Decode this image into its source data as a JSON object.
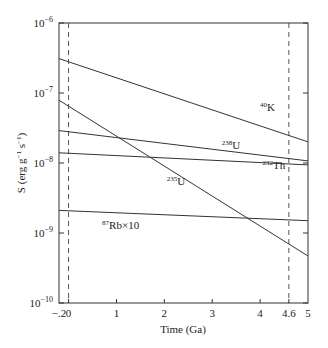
{
  "chart_data": {
    "type": "line",
    "title": "",
    "xlabel": "Time (Ga)",
    "ylabel": "S (erg g⁻¹ s⁻¹)",
    "xlim": [
      -0.2,
      5
    ],
    "ylim": [
      1e-10,
      1e-06
    ],
    "yscale": "log",
    "grid": false,
    "legend": "inline labels",
    "x_ticks": [
      {
        "value": -0.2,
        "label": "−2"
      },
      {
        "value": 0,
        "label": "0"
      },
      {
        "value": 1,
        "label": "1"
      },
      {
        "value": 2,
        "label": "2"
      },
      {
        "value": 3,
        "label": "3"
      },
      {
        "value": 4,
        "label": "4"
      },
      {
        "value": 4.6,
        "label": "4.6"
      },
      {
        "value": 5,
        "label": "5"
      }
    ],
    "y_ticks": [
      {
        "exp": -6,
        "base": "10",
        "sup": "−6"
      },
      {
        "exp": -7,
        "base": "10",
        "sup": "−7"
      },
      {
        "exp": -8,
        "base": "10",
        "sup": "−8"
      },
      {
        "exp": -9,
        "base": "10",
        "sup": "−9"
      },
      {
        "exp": -10,
        "base": "10",
        "sup": "−10"
      }
    ],
    "reference_lines": [
      {
        "x": 0,
        "style": "dashed"
      },
      {
        "x": 4.6,
        "style": "dashed"
      }
    ],
    "series": [
      {
        "name": "40K",
        "sup": "40",
        "base": "K",
        "x": [
          -0.2,
          5
        ],
        "values": [
          3.1e-07,
          2e-08
        ],
        "label_at": [
          4.0,
          5.6e-08
        ]
      },
      {
        "name": "238U",
        "sup": "238",
        "base": "U",
        "x": [
          -0.2,
          5
        ],
        "values": [
          2.9e-08,
          1.07e-08
        ],
        "label_at": [
          3.2,
          1.6e-08
        ]
      },
      {
        "name": "232Th",
        "sup": "232",
        "base": "Th",
        "x": [
          -0.2,
          5
        ],
        "values": [
          1.4e-08,
          9.4e-09
        ],
        "label_at": [
          4.05,
          8.2e-09
        ]
      },
      {
        "name": "235U",
        "sup": "235",
        "base": "U",
        "x": [
          -0.2,
          5
        ],
        "values": [
          7.9e-08,
          4.7e-10
        ],
        "label_at": [
          2.05,
          4.8e-09
        ]
      },
      {
        "name": "87Rb×10",
        "sup": "87",
        "base": "Rb×10",
        "x": [
          -0.2,
          5
        ],
        "values": [
          2.1e-09,
          1.5e-09
        ],
        "label_at": [
          0.7,
          1.15e-09
        ]
      }
    ]
  }
}
